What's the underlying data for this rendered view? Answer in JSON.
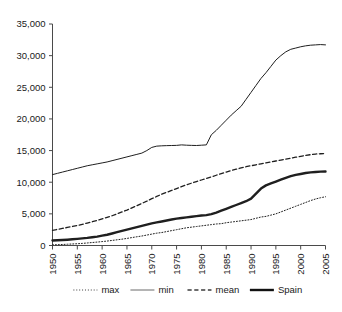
{
  "chart_data": {
    "type": "line",
    "title": "",
    "subtitle": "",
    "xlabel": "",
    "ylabel": "",
    "xlim": [
      1950,
      2005
    ],
    "ylim": [
      0,
      35000
    ],
    "grid": false,
    "legend_position": "bottom",
    "x_tick_labels": [
      "1950",
      "1955",
      "1960",
      "1965",
      "1970",
      "1975",
      "1980",
      "1985",
      "1990",
      "1995",
      "2000",
      "2005"
    ],
    "y_tick_labels": [
      "0",
      "5,000",
      "10,000",
      "15,000",
      "20,000",
      "25,000",
      "30,000",
      "35,000"
    ],
    "y_tick_values": [
      0,
      5000,
      10000,
      15000,
      20000,
      25000,
      30000,
      35000
    ],
    "x": [
      1950,
      1951,
      1952,
      1953,
      1954,
      1955,
      1956,
      1957,
      1958,
      1959,
      1960,
      1961,
      1962,
      1963,
      1964,
      1965,
      1966,
      1967,
      1968,
      1969,
      1970,
      1971,
      1972,
      1973,
      1974,
      1975,
      1976,
      1977,
      1978,
      1979,
      1980,
      1981,
      1982,
      1983,
      1984,
      1985,
      1986,
      1987,
      1988,
      1989,
      1990,
      1991,
      1992,
      1993,
      1994,
      1995,
      1996,
      1997,
      1998,
      1999,
      2000,
      2001,
      2002,
      2003,
      2004,
      2005
    ],
    "series": [
      {
        "name": "max",
        "style": "dotted",
        "color": "#3c3c3c",
        "width": 1,
        "values": [
          100,
          130,
          160,
          200,
          240,
          280,
          330,
          400,
          470,
          540,
          620,
          700,
          800,
          900,
          1000,
          1120,
          1250,
          1380,
          1500,
          1650,
          1800,
          1950,
          2050,
          2200,
          2350,
          2500,
          2650,
          2800,
          2900,
          3000,
          3100,
          3200,
          3300,
          3400,
          3450,
          3600,
          3700,
          3800,
          3900,
          4000,
          4100,
          4300,
          4500,
          4600,
          4800,
          5000,
          5300,
          5600,
          5900,
          6200,
          6500,
          6800,
          7100,
          7350,
          7550,
          7700
        ]
      },
      {
        "name": "min",
        "style": "solid",
        "color": "#6a6a6a",
        "width": 1,
        "values": [
          11200,
          11400,
          11600,
          11800,
          12000,
          12200,
          12400,
          12600,
          12750,
          12900,
          13050,
          13200,
          13400,
          13600,
          13800,
          14000,
          14200,
          14400,
          14600,
          15000,
          15500,
          15700,
          15750,
          15780,
          15800,
          15820,
          15900,
          15850,
          15820,
          15800,
          15850,
          15900,
          17500,
          18200,
          19000,
          19800,
          20600,
          21300,
          22000,
          23100,
          24200,
          25300,
          26400,
          27300,
          28300,
          29300,
          30000,
          30600,
          31000,
          31200,
          31400,
          31550,
          31650,
          31700,
          31750,
          31700
        ]
      },
      {
        "name": "mean",
        "style": "dashed",
        "color": "#3c3c3c",
        "width": 1.3,
        "values": [
          2400,
          2550,
          2700,
          2850,
          3000,
          3150,
          3350,
          3550,
          3750,
          3950,
          4200,
          4450,
          4700,
          5000,
          5300,
          5600,
          5950,
          6300,
          6650,
          7000,
          7400,
          7750,
          8100,
          8400,
          8700,
          9000,
          9300,
          9600,
          9850,
          10100,
          10350,
          10600,
          10850,
          11100,
          11350,
          11600,
          11850,
          12050,
          12250,
          12450,
          12600,
          12750,
          12900,
          13050,
          13200,
          13350,
          13500,
          13650,
          13800,
          13950,
          14100,
          14250,
          14350,
          14450,
          14500,
          14550
        ]
      },
      {
        "name": "Spain",
        "style": "solid",
        "color": "#111111",
        "width": 2.4,
        "values": [
          800,
          830,
          870,
          920,
          980,
          1050,
          1120,
          1200,
          1300,
          1400,
          1550,
          1700,
          1900,
          2100,
          2300,
          2500,
          2700,
          2900,
          3100,
          3300,
          3500,
          3650,
          3800,
          3950,
          4100,
          4250,
          4350,
          4450,
          4550,
          4650,
          4750,
          4800,
          4950,
          5200,
          5500,
          5800,
          6100,
          6400,
          6700,
          7000,
          7400,
          8200,
          9000,
          9500,
          9800,
          10100,
          10400,
          10700,
          10950,
          11150,
          11300,
          11450,
          11550,
          11620,
          11680,
          11700
        ]
      }
    ],
    "legend": [
      {
        "label": "max",
        "style": "dotted"
      },
      {
        "label": "min",
        "style": "solid-thin"
      },
      {
        "label": "mean",
        "style": "dashed"
      },
      {
        "label": "Spain",
        "style": "solid-thick"
      }
    ]
  }
}
